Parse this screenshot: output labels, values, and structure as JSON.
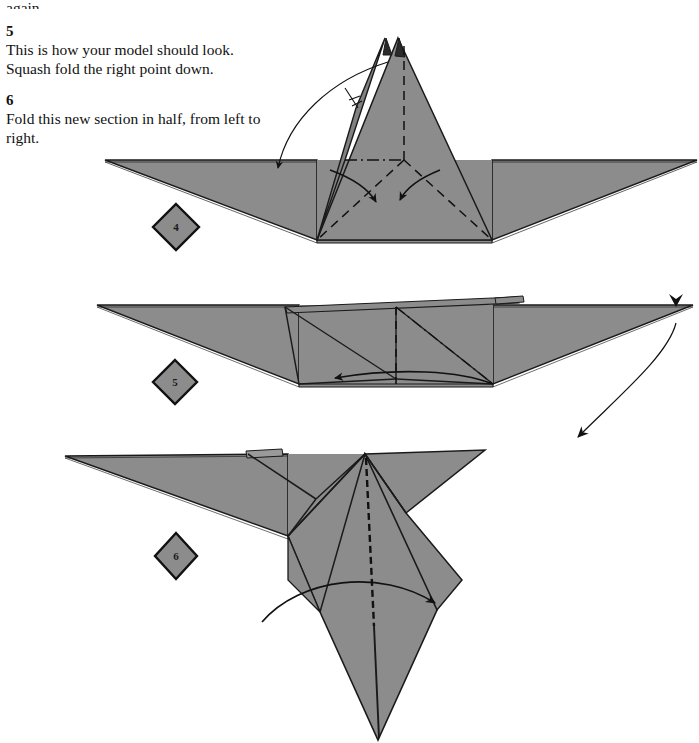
{
  "page": {
    "width": 699,
    "height": 743,
    "background": "#ffffff",
    "ink": "#111111",
    "paper_gray": "#8c8c8c",
    "paper_gray_edge": "#9a9a9a",
    "paper_gray_shade": "#7e7e7e",
    "outline": "#1a1a1a",
    "badge_fill": "#8c8c8c"
  },
  "continuation": {
    "text": "again."
  },
  "steps": [
    {
      "number": "5",
      "body": "This is how your model should look. Squash fold the right point down.",
      "line1": "This is how your model should look.",
      "line2": "Squash fold the right point down."
    },
    {
      "number": "6",
      "body": "Fold this new section in half, from left to right.",
      "line1": "Fold this new section in half, from left to",
      "line2": "right."
    }
  ],
  "figures": [
    {
      "id": "figure-4",
      "badge_label": "4",
      "caption_role": "squash-fold-preparation",
      "annotations": [
        {
          "name": "squash-fold-arrow",
          "kind": "curved-arrow",
          "direction": "down-left"
        },
        {
          "name": "squash-fold-symbol",
          "kind": "double-tick",
          "direction": "down-left"
        },
        {
          "name": "valley-fold-arrow-left",
          "kind": "curved-arrow",
          "direction": "down-right"
        },
        {
          "name": "valley-fold-arrow-right",
          "kind": "curved-arrow",
          "direction": "down-left"
        },
        {
          "name": "center-crease",
          "kind": "dashed-line",
          "direction": "vertical"
        },
        {
          "name": "valley-crease-left",
          "kind": "dashed-line"
        },
        {
          "name": "valley-crease-right",
          "kind": "dashed-line"
        },
        {
          "name": "horizon-crease",
          "kind": "dash-dot-line"
        }
      ]
    },
    {
      "id": "figure-5",
      "badge_label": "5",
      "caption_role": "flattened-model",
      "annotations": [
        {
          "name": "fold-direction-arrow",
          "kind": "curved-arrow",
          "direction": "left"
        },
        {
          "name": "turn-over-arrow",
          "kind": "long-curved-arrow",
          "direction": "down-left"
        },
        {
          "name": "point-marker",
          "kind": "arrowhead",
          "direction": "down"
        },
        {
          "name": "center-crease",
          "kind": "dashed-line",
          "direction": "vertical"
        },
        {
          "name": "diagonal-crease",
          "kind": "dash-dot-line"
        }
      ]
    },
    {
      "id": "figure-6",
      "badge_label": "6",
      "caption_role": "fold-new-section-in-half",
      "annotations": [
        {
          "name": "fold-in-half-arrow",
          "kind": "curved-arrow",
          "direction": "right"
        },
        {
          "name": "center-crease",
          "kind": "dashed-line",
          "direction": "vertical"
        }
      ]
    }
  ]
}
